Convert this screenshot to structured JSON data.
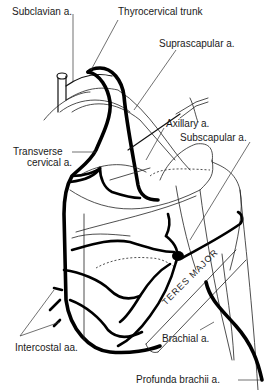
{
  "diagram": {
    "type": "anatomical-illustration",
    "labels": {
      "subclavian": "Subclavian a.",
      "thyrocervical": "Thyrocervical trunk",
      "suprascapular": "Suprascapular a.",
      "axillary": "Axillary a.",
      "subscapular": "Subscapular a.",
      "transverse_cervical_1": "Transverse",
      "transverse_cervical_2": "cervical a.",
      "intercostal": "Intercostal aa.",
      "brachial": "Brachial a.",
      "profunda_brachii": "Profunda brachii a.",
      "teres_major": "TERES MAJOR"
    },
    "colors": {
      "line": "#000000",
      "background": "#ffffff",
      "text": "#1a1a1a"
    }
  }
}
